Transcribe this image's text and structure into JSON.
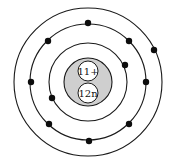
{
  "diagram": {
    "type": "bohr-atom-model",
    "center": [
      88,
      82
    ],
    "colors": {
      "line": "#1a1a1a",
      "electron": "#0d0d0d",
      "nucleus_fill": "#cfcfcf",
      "particle_fill": "#ffffff",
      "background": "#ffffff"
    },
    "nucleus": {
      "radius": 24,
      "protons": {
        "label": "11+",
        "cx": 88,
        "cy": 71,
        "r": 10
      },
      "neutrons": {
        "label": "12n",
        "cx": 88,
        "cy": 93,
        "r": 10
      }
    },
    "shells": [
      {
        "name": "shell-1",
        "radius": 39,
        "electron_count": 2,
        "electrons": [
          [
            125,
            65
          ],
          [
            52,
            98
          ]
        ]
      },
      {
        "name": "shell-2",
        "radius": 58,
        "electron_count": 8,
        "electrons": [
          [
            88,
            23
          ],
          [
            48,
            41
          ],
          [
            129,
            41
          ],
          [
            31,
            82
          ],
          [
            146,
            82
          ],
          [
            49,
            124
          ],
          [
            129,
            124
          ],
          [
            89,
            141
          ]
        ]
      },
      {
        "name": "shell-3",
        "radius": 74,
        "electron_count": 1,
        "electrons": [
          [
            154,
            50
          ]
        ]
      }
    ],
    "electron_radius": 3.2
  }
}
